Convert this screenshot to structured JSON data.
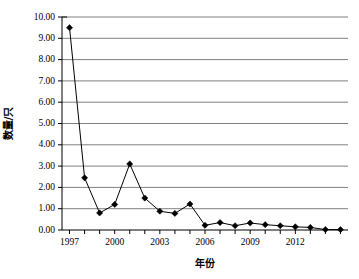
{
  "chart_data": {
    "type": "line",
    "title": "",
    "xlabel": "年份",
    "ylabel": "数量/只",
    "xlim": [
      1996.5,
      2015.5
    ],
    "ylim": [
      0,
      10
    ],
    "grid": true,
    "legend": null,
    "y_ticks": [
      "0.00",
      "1.00",
      "2.00",
      "3.00",
      "4.00",
      "5.00",
      "6.00",
      "7.00",
      "8.00",
      "9.00",
      "10.00"
    ],
    "y_tick_values": [
      0,
      1,
      2,
      3,
      4,
      5,
      6,
      7,
      8,
      9,
      10
    ],
    "x_tick_labels": [
      "1997",
      "2000",
      "2003",
      "2006",
      "2009",
      "2012"
    ],
    "x_tick_label_values": [
      1997,
      2000,
      2003,
      2006,
      2009,
      2012
    ],
    "x_minor_ticks": [
      1997,
      1998,
      1999,
      2000,
      2001,
      2002,
      2003,
      2004,
      2005,
      2006,
      2007,
      2008,
      2009,
      2010,
      2011,
      2012,
      2013,
      2014,
      2015
    ],
    "x": [
      1997,
      1998,
      1999,
      2000,
      2001,
      2002,
      2003,
      2004,
      2005,
      2006,
      2007,
      2008,
      2009,
      2010,
      2011,
      2012,
      2013,
      2014,
      2015
    ],
    "categories": [
      "1997",
      "1998",
      "1999",
      "2000",
      "2001",
      "2002",
      "2003",
      "2004",
      "2005",
      "2006",
      "2007",
      "2008",
      "2009",
      "2010",
      "2011",
      "2012",
      "2013",
      "2014",
      "2015"
    ],
    "values": [
      9.5,
      2.45,
      0.8,
      1.2,
      3.1,
      1.5,
      0.88,
      0.78,
      1.22,
      0.22,
      0.35,
      0.2,
      0.33,
      0.25,
      0.2,
      0.15,
      0.12,
      0.02,
      0.02
    ],
    "series": [
      {
        "name": "数量/只",
        "values": [
          9.5,
          2.45,
          0.8,
          1.2,
          3.1,
          1.5,
          0.88,
          0.78,
          1.22,
          0.22,
          0.35,
          0.2,
          0.33,
          0.25,
          0.2,
          0.15,
          0.12,
          0.02,
          0.02
        ],
        "marker": "diamond",
        "color": "#000000"
      }
    ],
    "colors": {
      "line": "#000000",
      "marker": "#000000",
      "grid": "#808080",
      "axis": "#000000",
      "background": "#ffffff"
    }
  }
}
